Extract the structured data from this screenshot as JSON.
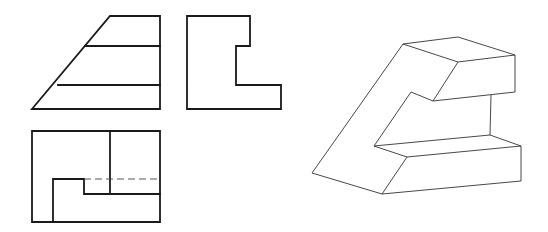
{
  "drawing": {
    "colors": {
      "line": "#1a1a1a",
      "iso_line": "#333333",
      "background": "#ffffff"
    },
    "front_view": {
      "outline": [
        [
          110,
          16
        ],
        [
          160,
          16
        ],
        [
          160,
          109
        ],
        [
          32,
          109
        ]
      ],
      "horizontal_lines": [
        [
          [
            85,
            46
          ],
          [
            160,
            46
          ]
        ],
        [
          [
            58,
            85
          ],
          [
            160,
            85
          ]
        ]
      ]
    },
    "side_view": {
      "outline": [
        [
          187,
          16
        ],
        [
          250,
          16
        ],
        [
          250,
          46
        ],
        [
          236,
          46
        ],
        [
          236,
          85
        ],
        [
          281,
          85
        ],
        [
          281,
          109
        ],
        [
          187,
          109
        ]
      ]
    },
    "top_view": {
      "outline": [
        [
          32,
          131
        ],
        [
          160,
          131
        ],
        [
          160,
          222
        ],
        [
          32,
          222
        ]
      ],
      "visible_lines": [
        [
          [
            110,
            131
          ],
          [
            110,
            194
          ]
        ],
        [
          [
            53,
            222
          ],
          [
            53,
            179
          ],
          [
            84,
            179
          ],
          [
            84,
            194
          ],
          [
            160,
            194
          ]
        ]
      ],
      "hidden_lines": [
        [
          [
            84,
            179
          ],
          [
            160,
            179
          ]
        ]
      ]
    },
    "isometric_view": {
      "edges": [
        [
          [
            403,
            44
          ],
          [
            458,
            37
          ],
          [
            515,
            55
          ],
          [
            458,
            62
          ],
          [
            403,
            44
          ]
        ],
        [
          [
            515,
            55
          ],
          [
            515,
            92
          ],
          [
            433,
            101
          ],
          [
            458,
            62
          ]
        ],
        [
          [
            433,
            101
          ],
          [
            411,
            92
          ],
          [
            374,
            146
          ],
          [
            490,
            135
          ],
          [
            521,
            146
          ],
          [
            407,
            157
          ],
          [
            374,
            146
          ]
        ],
        [
          [
            491,
            95
          ],
          [
            490,
            135
          ]
        ],
        [
          [
            521,
            146
          ],
          [
            521,
            181
          ],
          [
            382,
            194
          ],
          [
            312,
            173
          ],
          [
            403,
            44
          ]
        ],
        [
          [
            407,
            157
          ],
          [
            382,
            194
          ]
        ]
      ]
    }
  }
}
